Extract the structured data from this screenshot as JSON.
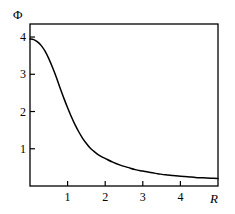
{
  "chart_data": {
    "type": "line",
    "title": "",
    "xlabel": "R",
    "ylabel": "Φ",
    "xlim": [
      0,
      5
    ],
    "ylim": [
      0,
      4.35
    ],
    "grid": false,
    "legend": null,
    "xticks": [
      "1",
      "2",
      "3",
      "4"
    ],
    "xtick_values": [
      1,
      2,
      3,
      4
    ],
    "yticks": [
      "1",
      "2",
      "3",
      "4"
    ],
    "ytick_values": [
      1,
      2,
      3,
      4
    ],
    "frame": "box",
    "series": [
      {
        "name": "Φ(R)",
        "color": "#000000",
        "x": [
          0.0,
          0.1,
          0.2,
          0.3,
          0.4,
          0.5,
          0.6,
          0.7,
          0.8,
          0.9,
          1.0,
          1.1,
          1.2,
          1.3,
          1.4,
          1.5,
          1.6,
          1.7,
          1.8,
          1.9,
          2.0,
          2.2,
          2.4,
          2.6,
          2.8,
          3.0,
          3.2,
          3.4,
          3.6,
          3.8,
          4.0,
          4.2,
          4.4,
          4.6,
          4.8,
          5.0
        ],
        "y": [
          3.95,
          3.93,
          3.87,
          3.77,
          3.62,
          3.42,
          3.18,
          2.92,
          2.63,
          2.36,
          2.1,
          1.86,
          1.64,
          1.45,
          1.28,
          1.14,
          1.02,
          0.93,
          0.85,
          0.79,
          0.74,
          0.64,
          0.56,
          0.5,
          0.44,
          0.4,
          0.36,
          0.33,
          0.3,
          0.28,
          0.26,
          0.25,
          0.23,
          0.22,
          0.21,
          0.2
        ]
      }
    ]
  },
  "labels": {
    "y_axis_title": "Φ",
    "x_axis_title": "R"
  }
}
